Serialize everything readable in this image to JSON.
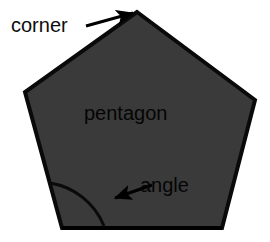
{
  "canvas": {
    "width": 270,
    "height": 242,
    "background_color": "#ffffff"
  },
  "figure": {
    "name": "pentagon-diagram",
    "shape_type": "pentagon",
    "fill_color": "#3a3a3a",
    "stroke_color": "#0a0a0a",
    "stroke_width": 4,
    "vertices": [
      {
        "name": "top",
        "x": 137,
        "y": 12
      },
      {
        "name": "right",
        "x": 255,
        "y": 100
      },
      {
        "name": "bottom-right",
        "x": 222,
        "y": 228
      },
      {
        "name": "bottom-left",
        "x": 62,
        "y": 228
      },
      {
        "name": "left",
        "x": 25,
        "y": 92
      }
    ]
  },
  "annotations": {
    "corner": {
      "label": "corner",
      "text_color": "#0d0d0d",
      "font_size": 20,
      "text_x": 11,
      "text_y": 32,
      "arrow": {
        "from_x": 86,
        "from_y": 26,
        "to_x": 135,
        "to_y": 12,
        "color": "#000000",
        "width": 3
      }
    },
    "pentagon": {
      "label": "pentagon",
      "text_color": "#050505",
      "font_size": 21,
      "text_x": 84,
      "text_y": 120
    },
    "angle": {
      "label": "angle",
      "text_color": "#050505",
      "font_size": 21,
      "text_x": 140,
      "text_y": 192,
      "arrow": {
        "from_x": 152,
        "from_y": 185,
        "to_x": 112,
        "to_y": 199,
        "color": "#000000",
        "width": 3
      },
      "arc": {
        "center_x": 62,
        "center_y": 228,
        "radius": 70,
        "start_x": 50,
        "start_y": 183,
        "end_x": 104,
        "end_y": 226,
        "color": "#0a0a0a",
        "width": 3
      }
    }
  }
}
